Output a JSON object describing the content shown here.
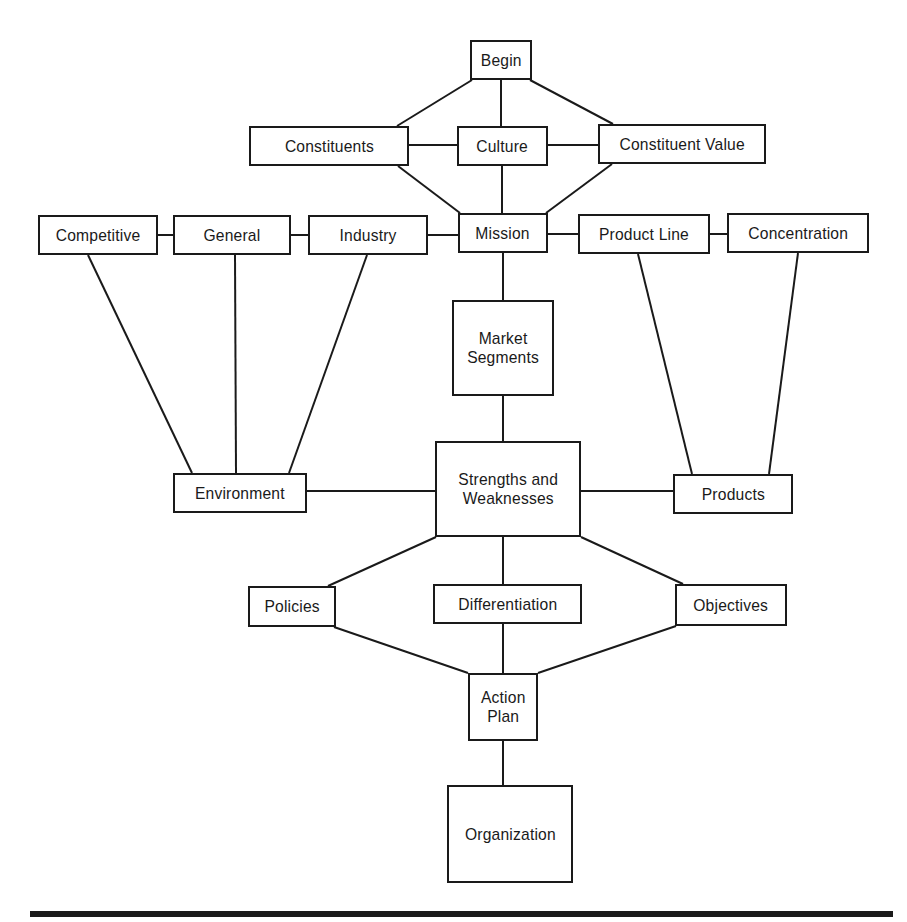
{
  "diagram": {
    "type": "strategic-planning-flow",
    "colors": {
      "stroke": "#1a1a1a",
      "background": "#ffffff",
      "text": "#1a1a1a"
    },
    "nodes": [
      {
        "id": "begin",
        "label": "Begin",
        "x": 470,
        "y": 40,
        "w": 62,
        "h": 40
      },
      {
        "id": "constituents",
        "label": "Constituents",
        "x": 249,
        "y": 126,
        "w": 160,
        "h": 40
      },
      {
        "id": "culture",
        "label": "Culture",
        "x": 457,
        "y": 126,
        "w": 91,
        "h": 40
      },
      {
        "id": "constituent-value",
        "label": "Constituent Value",
        "x": 598,
        "y": 124,
        "w": 168,
        "h": 40
      },
      {
        "id": "competitive",
        "label": "Competitive",
        "x": 38,
        "y": 215,
        "w": 120,
        "h": 40
      },
      {
        "id": "general",
        "label": "General",
        "x": 173,
        "y": 215,
        "w": 118,
        "h": 40
      },
      {
        "id": "industry",
        "label": "Industry",
        "x": 308,
        "y": 215,
        "w": 120,
        "h": 40
      },
      {
        "id": "mission",
        "label": "Mission",
        "x": 458,
        "y": 213,
        "w": 90,
        "h": 40
      },
      {
        "id": "product-line",
        "label": "Product Line",
        "x": 578,
        "y": 214,
        "w": 132,
        "h": 40
      },
      {
        "id": "concentration",
        "label": "Concentration",
        "x": 727,
        "y": 213,
        "w": 142,
        "h": 40
      },
      {
        "id": "market-segments",
        "label": "Market\nSegments",
        "x": 452,
        "y": 300,
        "w": 102,
        "h": 96
      },
      {
        "id": "environment",
        "label": "Environment",
        "x": 173,
        "y": 473,
        "w": 134,
        "h": 40
      },
      {
        "id": "strengths-weaknesses",
        "label": "Strengths and\nWeaknesses",
        "x": 435,
        "y": 441,
        "w": 146,
        "h": 96
      },
      {
        "id": "products",
        "label": "Products",
        "x": 673,
        "y": 474,
        "w": 120,
        "h": 40
      },
      {
        "id": "policies",
        "label": "Policies",
        "x": 248,
        "y": 586,
        "w": 88,
        "h": 41
      },
      {
        "id": "differentiation",
        "label": "Differentiation",
        "x": 433,
        "y": 584,
        "w": 149,
        "h": 40
      },
      {
        "id": "objectives",
        "label": "Objectives",
        "x": 675,
        "y": 584,
        "w": 112,
        "h": 42
      },
      {
        "id": "action-plan",
        "label": "Action\nPlan",
        "x": 468,
        "y": 673,
        "w": 70,
        "h": 68
      },
      {
        "id": "organization",
        "label": "Organization",
        "x": 447,
        "y": 785,
        "w": 126,
        "h": 98
      }
    ],
    "edges": [
      {
        "from": "begin",
        "to": "constituents",
        "x1": 472,
        "y1": 80,
        "x2": 397,
        "y2": 126
      },
      {
        "from": "begin",
        "to": "culture",
        "x1": 501,
        "y1": 80,
        "x2": 501,
        "y2": 126
      },
      {
        "from": "begin",
        "to": "constituent-value",
        "x1": 530,
        "y1": 80,
        "x2": 613,
        "y2": 124
      },
      {
        "from": "constituents",
        "to": "culture",
        "x1": 409,
        "y1": 145,
        "x2": 457,
        "y2": 145
      },
      {
        "from": "culture",
        "to": "constituent-value",
        "x1": 548,
        "y1": 145,
        "x2": 598,
        "y2": 145
      },
      {
        "from": "constituents",
        "to": "mission",
        "x1": 398,
        "y1": 166,
        "x2": 460,
        "y2": 213
      },
      {
        "from": "culture",
        "to": "mission",
        "x1": 502,
        "y1": 166,
        "x2": 502,
        "y2": 213
      },
      {
        "from": "constituent-value",
        "to": "mission",
        "x1": 612,
        "y1": 164,
        "x2": 546,
        "y2": 213
      },
      {
        "from": "competitive",
        "to": "general",
        "x1": 158,
        "y1": 235,
        "x2": 173,
        "y2": 235
      },
      {
        "from": "general",
        "to": "industry",
        "x1": 291,
        "y1": 235,
        "x2": 308,
        "y2": 235
      },
      {
        "from": "industry",
        "to": "mission",
        "x1": 428,
        "y1": 235,
        "x2": 458,
        "y2": 235
      },
      {
        "from": "mission",
        "to": "product-line",
        "x1": 548,
        "y1": 234,
        "x2": 578,
        "y2": 234
      },
      {
        "from": "product-line",
        "to": "concentration",
        "x1": 710,
        "y1": 234,
        "x2": 727,
        "y2": 234
      },
      {
        "from": "mission",
        "to": "market-segments",
        "x1": 503,
        "y1": 253,
        "x2": 503,
        "y2": 300
      },
      {
        "from": "competitive",
        "to": "environment",
        "x1": 88,
        "y1": 255,
        "x2": 192,
        "y2": 473
      },
      {
        "from": "general",
        "to": "environment",
        "x1": 235,
        "y1": 255,
        "x2": 236,
        "y2": 473
      },
      {
        "from": "industry",
        "to": "environment",
        "x1": 367,
        "y1": 255,
        "x2": 289,
        "y2": 473
      },
      {
        "from": "product-line",
        "to": "products",
        "x1": 638,
        "y1": 254,
        "x2": 692,
        "y2": 474
      },
      {
        "from": "concentration",
        "to": "products",
        "x1": 798,
        "y1": 253,
        "x2": 769,
        "y2": 474
      },
      {
        "from": "market-segments",
        "to": "strengths-weaknesses",
        "x1": 503,
        "y1": 396,
        "x2": 503,
        "y2": 441
      },
      {
        "from": "environment",
        "to": "strengths-weaknesses",
        "x1": 307,
        "y1": 491,
        "x2": 435,
        "y2": 491
      },
      {
        "from": "strengths-weaknesses",
        "to": "products",
        "x1": 581,
        "y1": 491,
        "x2": 673,
        "y2": 491
      },
      {
        "from": "strengths-weaknesses",
        "to": "policies",
        "x1": 436,
        "y1": 537,
        "x2": 328,
        "y2": 586
      },
      {
        "from": "strengths-weaknesses",
        "to": "differentiation",
        "x1": 503,
        "y1": 537,
        "x2": 503,
        "y2": 584
      },
      {
        "from": "strengths-weaknesses",
        "to": "objectives",
        "x1": 581,
        "y1": 537,
        "x2": 683,
        "y2": 584
      },
      {
        "from": "policies",
        "to": "action-plan",
        "x1": 334,
        "y1": 627,
        "x2": 468,
        "y2": 673
      },
      {
        "from": "differentiation",
        "to": "action-plan",
        "x1": 503,
        "y1": 624,
        "x2": 503,
        "y2": 673
      },
      {
        "from": "objectives",
        "to": "action-plan",
        "x1": 676,
        "y1": 626,
        "x2": 538,
        "y2": 673
      },
      {
        "from": "action-plan",
        "to": "organization",
        "x1": 503,
        "y1": 741,
        "x2": 503,
        "y2": 785
      }
    ],
    "bottom_rule": {
      "x": 30,
      "y": 911,
      "w": 863,
      "h": 6
    }
  }
}
